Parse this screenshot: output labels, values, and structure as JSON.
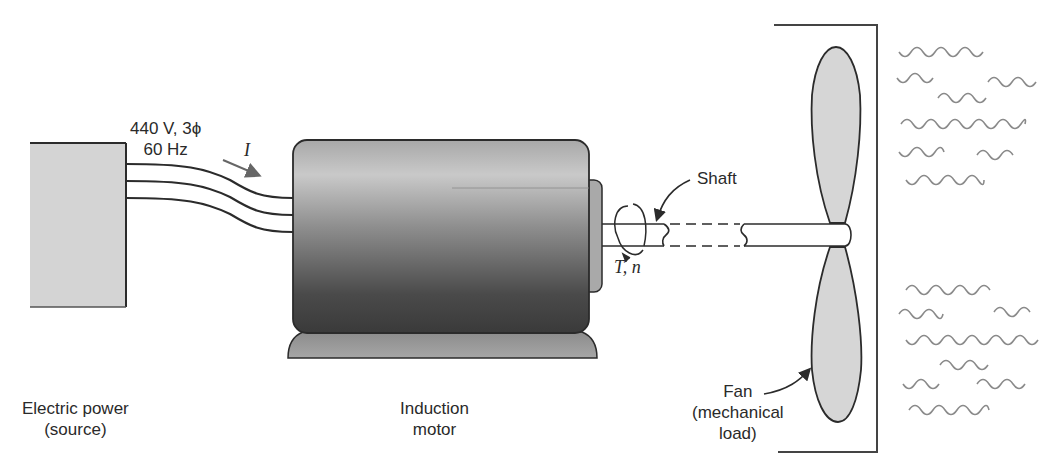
{
  "diagram": {
    "source": {
      "label_line1": "Electric power",
      "label_line2": "(source)"
    },
    "supply": {
      "rating_line1": "440 V, 3ϕ",
      "rating_line2": "60 Hz",
      "current_symbol": "I"
    },
    "motor": {
      "label_line1": "Induction",
      "label_line2": "motor"
    },
    "shaft": {
      "label": "Shaft",
      "torque_speed": "T, n"
    },
    "fan": {
      "label_line1": "Fan",
      "label_line2": "(mechanical",
      "label_line3": "load)"
    },
    "colors": {
      "box_fill": "#d4d4d4",
      "motor_light": "#c8c8c8",
      "motor_dark": "#404040",
      "wave": "#8a8a8a",
      "line": "#2b2b2b"
    }
  }
}
